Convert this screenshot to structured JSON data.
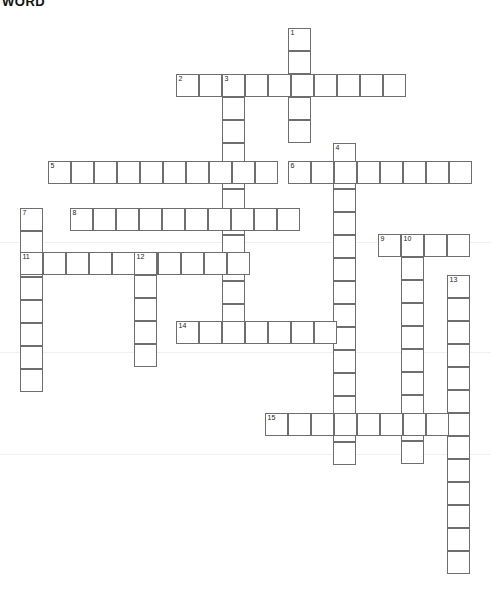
{
  "page": {
    "title": "WORD",
    "background_color": "#ffffff",
    "cell_border_color": "#6e6e6e",
    "cell_soft_border_color": "#b9b9b9",
    "cell_fill_color": "#ffffff",
    "number_color": "#1a1a1a",
    "cell_size": 23,
    "width": 491,
    "height": 612
  },
  "crossword": {
    "type": "crossword-grid",
    "cell_size": 23,
    "entries": [
      {
        "number": "1",
        "direction": "down",
        "x": 288,
        "y": 28,
        "length": 5
      },
      {
        "number": "2",
        "direction": "across",
        "x": 176,
        "y": 74,
        "length": 10
      },
      {
        "number": "3",
        "direction": "down",
        "x": 222,
        "y": 74,
        "length": 11
      },
      {
        "number": "4",
        "direction": "down",
        "x": 333,
        "y": 143,
        "length": 14
      },
      {
        "number": "5",
        "direction": "across",
        "x": 48,
        "y": 161,
        "length": 10
      },
      {
        "number": "6",
        "direction": "across",
        "x": 288,
        "y": 161,
        "length": 8
      },
      {
        "number": "7",
        "direction": "down",
        "x": 20,
        "y": 208,
        "length": 8
      },
      {
        "number": "8",
        "direction": "across",
        "x": 70,
        "y": 208,
        "length": 10
      },
      {
        "number": "9",
        "direction": "across",
        "x": 378,
        "y": 234,
        "length": 4
      },
      {
        "number": "10",
        "direction": "down",
        "x": 401,
        "y": 234,
        "length": 10
      },
      {
        "number": "11",
        "direction": "across",
        "x": 20,
        "y": 252,
        "length": 10
      },
      {
        "number": "12",
        "direction": "down",
        "x": 134,
        "y": 252,
        "length": 5
      },
      {
        "number": "13",
        "direction": "down",
        "x": 447,
        "y": 275,
        "length": 13
      },
      {
        "number": "14",
        "direction": "across",
        "x": 176,
        "y": 321,
        "length": 7
      },
      {
        "number": "15",
        "direction": "across",
        "x": 265,
        "y": 413,
        "length": 8
      }
    ],
    "soft_cells": [
      {
        "x": 269,
        "y": 208
      },
      {
        "x": 361,
        "y": 413
      }
    ],
    "faint_rules": [
      {
        "y": 242
      },
      {
        "y": 352
      },
      {
        "y": 454
      }
    ]
  }
}
